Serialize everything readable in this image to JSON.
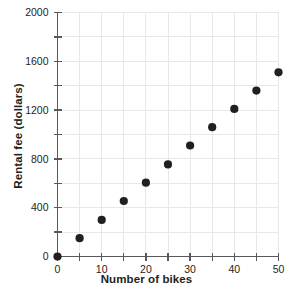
{
  "chart_data": {
    "type": "scatter",
    "title": "",
    "xlabel": "Number of bikes",
    "ylabel": "Rental fee (dollars)",
    "xlim": [
      0,
      50
    ],
    "ylim": [
      0,
      2000
    ],
    "x": [
      0,
      5,
      10,
      15,
      20,
      25,
      30,
      35,
      40,
      45,
      50
    ],
    "values": [
      0,
      150,
      300,
      455,
      605,
      755,
      910,
      1060,
      1210,
      1360,
      1510
    ],
    "xticks": [
      0,
      10,
      20,
      30,
      40,
      50
    ],
    "xticklabels": [
      "0",
      "10",
      "20",
      "30",
      "40",
      "50"
    ],
    "xminorticks": [
      5,
      15,
      25,
      35,
      45
    ],
    "yticks": [
      0,
      400,
      800,
      1200,
      1600,
      2000
    ],
    "yticklabels": [
      "0",
      "400",
      "800",
      "1200",
      "1600",
      "2000"
    ],
    "yminorticks": [
      200,
      600,
      1000,
      1400,
      1800
    ],
    "gridlines_x_step": 5,
    "gridlines_y_step": 200,
    "grid": true,
    "legend": "none",
    "marker": "filled-circle",
    "marker_color": "#231f20",
    "grid_color": "#e8e8e8",
    "axis_color": "#58595b"
  }
}
